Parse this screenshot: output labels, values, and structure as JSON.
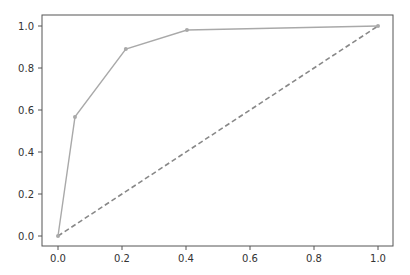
{
  "chart_data": {
    "type": "line",
    "title": "",
    "xlabel": "",
    "ylabel": "",
    "xlim": [
      -0.05,
      1.05
    ],
    "ylim": [
      -0.05,
      1.05
    ],
    "grid": false,
    "legend": null,
    "xticks": [
      "0.0",
      "0.2",
      "0.4",
      "0.6",
      "0.8",
      "1.0"
    ],
    "yticks": [
      "0.0",
      "0.2",
      "0.4",
      "0.6",
      "0.8",
      "1.0"
    ],
    "series": [
      {
        "name": "curve",
        "style": "solid",
        "marker": "dot",
        "color": "#a9a9a9",
        "x": [
          0.0,
          0.053,
          0.212,
          0.403,
          1.0
        ],
        "y": [
          0.0,
          0.567,
          0.89,
          0.981,
          1.0
        ]
      },
      {
        "name": "diagonal",
        "style": "dashed",
        "marker": "none",
        "color": "#888888",
        "x": [
          0.0,
          1.0
        ],
        "y": [
          0.0,
          1.0
        ]
      }
    ]
  },
  "colors": {
    "axis": "#555555",
    "text": "#333333",
    "background": "#ffffff"
  }
}
